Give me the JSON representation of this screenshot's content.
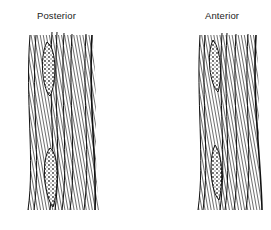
{
  "figure": {
    "panels": [
      {
        "label": "Posterior",
        "bone_segments": 2
      },
      {
        "label": "Anterior",
        "bone_segments": 2
      }
    ]
  }
}
